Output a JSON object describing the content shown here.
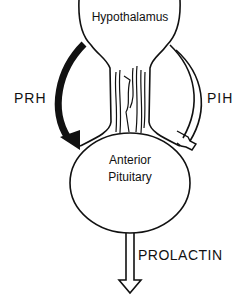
{
  "diagram": {
    "nodes": {
      "hypothalamus": "Hypothalamus",
      "anterior_pituitary_line1": "Anterior",
      "anterior_pituitary_line2": "Pituitary"
    },
    "edges": {
      "stimulatory": "PRH",
      "inhibitory": "PIH",
      "output": "PROLACTIN"
    },
    "colors": {
      "stroke": "#111111",
      "background": "#ffffff"
    }
  }
}
